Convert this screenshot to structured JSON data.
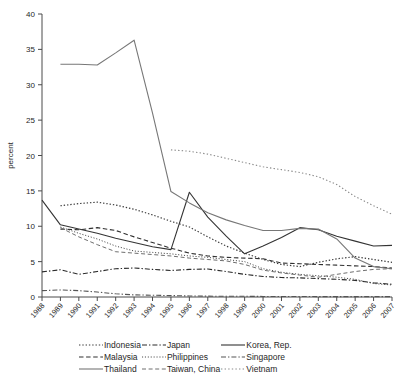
{
  "chart_data": {
    "type": "line",
    "title": "",
    "xlabel": "",
    "ylabel": "percent",
    "ylim": [
      0,
      40
    ],
    "yticks": [
      0,
      5,
      10,
      15,
      20,
      25,
      30,
      35,
      40
    ],
    "grid": false,
    "legend_position": "bottom",
    "x": [
      1988,
      1989,
      1990,
      1991,
      1992,
      1993,
      1994,
      1995,
      1996,
      1997,
      1998,
      1999,
      2000,
      2001,
      2002,
      2003,
      2004,
      2005,
      2006,
      2007
    ],
    "categories": [
      "1988",
      "1989",
      "1990",
      "1991",
      "1992",
      "1993",
      "1994",
      "1995",
      "1996",
      "1997",
      "1998",
      "1999",
      "2000",
      "2001",
      "2002",
      "2003",
      "2004",
      "2005",
      "2006",
      "2007"
    ],
    "series": [
      {
        "name": "Indonesia",
        "style": "dotted",
        "color": "#3a3a3a",
        "values": [
          null,
          12.9,
          13.2,
          13.4,
          13.0,
          12.4,
          11.6,
          10.7,
          9.9,
          8.5,
          7.2,
          6.2,
          5.3,
          4.6,
          4.3,
          4.9,
          5.4,
          5.7,
          5.3,
          4.9
        ]
      },
      {
        "name": "Japan",
        "style": "dash-dot",
        "color": "#2b2b2b",
        "values": [
          3.55,
          3.85,
          3.2,
          3.6,
          4.0,
          4.1,
          3.9,
          3.75,
          3.9,
          3.95,
          3.6,
          3.2,
          2.9,
          2.75,
          2.7,
          2.6,
          2.5,
          2.35,
          2.0,
          1.8
        ]
      },
      {
        "name": "Korea, Rep.",
        "style": "solid",
        "color": "#343434",
        "values": [
          13.7,
          10.2,
          9.6,
          9.0,
          8.3,
          7.7,
          7.1,
          6.7,
          14.8,
          11.3,
          8.6,
          6.1,
          7.2,
          8.4,
          9.8,
          9.5,
          8.6,
          7.9,
          7.2,
          7.3
        ]
      },
      {
        "name": "Malaysia",
        "style": "dashed",
        "color": "#303030",
        "values": [
          null,
          9.6,
          9.5,
          9.8,
          9.4,
          8.5,
          7.7,
          6.9,
          6.2,
          5.8,
          5.6,
          5.5,
          5.4,
          4.8,
          4.7,
          4.6,
          4.5,
          4.4,
          4.3,
          4.1
        ]
      },
      {
        "name": "Philippines",
        "style": "dotted-fine",
        "color": "#4a4a4a",
        "values": [
          null,
          9.9,
          9.0,
          8.2,
          7.2,
          6.5,
          6.3,
          6.1,
          5.8,
          5.6,
          5.3,
          5.0,
          4.0,
          3.5,
          3.2,
          3.0,
          2.8,
          2.5,
          1.9,
          1.7
        ]
      },
      {
        "name": "Singapore",
        "style": "dash-dot",
        "color": "#555555",
        "values": [
          0.9,
          1.0,
          0.9,
          0.7,
          0.45,
          0.3,
          0.25,
          0.2,
          0.15,
          0.12,
          0.1,
          0.1,
          0.08,
          0.08,
          0.07,
          0.06,
          0.05,
          0.05,
          0.05,
          0.05
        ]
      },
      {
        "name": "Thailand",
        "style": "solid",
        "color": "#777777",
        "values": [
          null,
          32.9,
          32.9,
          32.8,
          34.5,
          36.3,
          26.0,
          14.9,
          13.3,
          11.9,
          10.9,
          10.1,
          9.4,
          9.4,
          9.7,
          9.6,
          8.2,
          5.5,
          4.3,
          4.0
        ]
      },
      {
        "name": "Taiwan, China",
        "style": "dashed-light",
        "color": "#6e6e6e",
        "values": [
          null,
          9.8,
          8.5,
          7.4,
          6.4,
          6.2,
          6.0,
          5.8,
          5.5,
          5.3,
          5.1,
          4.6,
          3.8,
          3.4,
          3.1,
          2.8,
          3.2,
          3.6,
          3.9,
          4.0
        ]
      },
      {
        "name": "Vietnam",
        "style": "dotted-light",
        "color": "#8a8a8a",
        "values": [
          null,
          null,
          null,
          null,
          null,
          null,
          null,
          20.8,
          20.6,
          20.2,
          19.6,
          19.0,
          18.4,
          18.0,
          17.6,
          17.0,
          15.9,
          14.2,
          12.9,
          11.7
        ]
      }
    ]
  },
  "legend": {
    "rows": [
      [
        {
          "label": "Indonesia",
          "style": "dotted",
          "color": "#3a3a3a"
        },
        {
          "label": "Japan",
          "style": "dash-dot",
          "color": "#2b2b2b"
        },
        {
          "label": "Korea, Rep.",
          "style": "solid",
          "color": "#343434"
        }
      ],
      [
        {
          "label": "Malaysia",
          "style": "dashed",
          "color": "#303030"
        },
        {
          "label": "Philippines",
          "style": "dotted-fine",
          "color": "#4a4a4a"
        },
        {
          "label": "Singapore",
          "style": "dash-dot",
          "color": "#555555"
        }
      ],
      [
        {
          "label": "Thailand",
          "style": "solid",
          "color": "#777777"
        },
        {
          "label": "Taiwan, China",
          "style": "dashed-light",
          "color": "#6e6e6e"
        },
        {
          "label": "Vietnam",
          "style": "dotted-light",
          "color": "#8a8a8a"
        }
      ]
    ]
  },
  "colors": {
    "axis": "#4a4a4a",
    "text": "#262626",
    "background": "#ffffff"
  }
}
